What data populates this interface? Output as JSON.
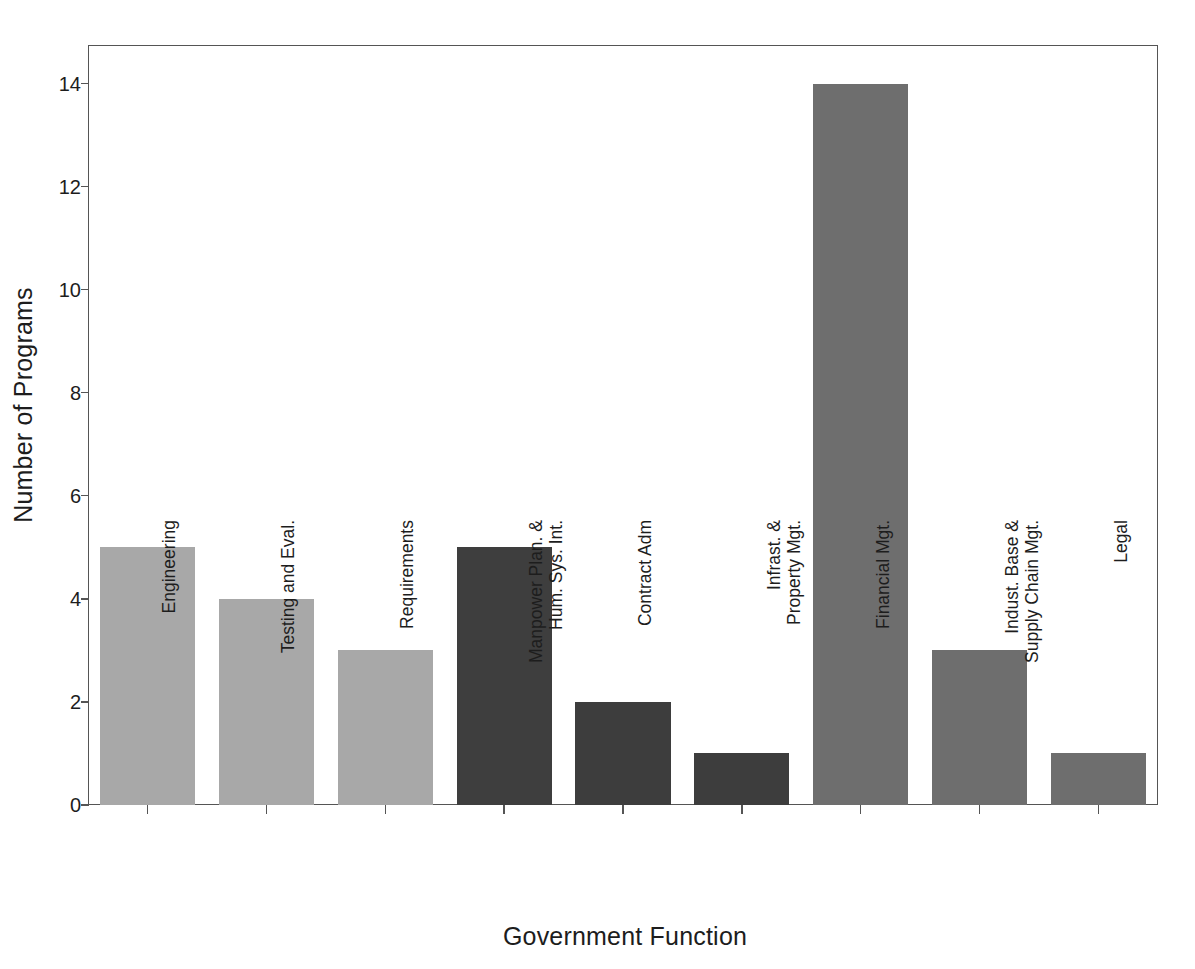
{
  "chart_data": {
    "type": "bar",
    "title": "",
    "xlabel": "Government Function",
    "ylabel": "Number of Programs",
    "categories": [
      "Engineering",
      "Testing and Eval.",
      "Requirements",
      "Manpower Plan. & Hum. Sys. Int.",
      "Contract Adm",
      "Infrast. & Property Mgt.",
      "Financial Mgt.",
      "Indust. Base & Supply Chain Mgt.",
      "Legal"
    ],
    "category_lines": [
      [
        "Engineering"
      ],
      [
        "Testing and Eval."
      ],
      [
        "Requirements"
      ],
      [
        "Manpower Plan. &",
        "Hum. Sys. Int."
      ],
      [
        "Contract Adm"
      ],
      [
        "Infrast. &",
        "Property Mgt."
      ],
      [
        "Financial Mgt."
      ],
      [
        "Indust. Base &",
        "Supply Chain Mgt."
      ],
      [
        "Legal"
      ]
    ],
    "values": [
      5,
      4,
      3,
      5,
      2,
      1,
      14,
      3,
      1
    ],
    "bar_colors": [
      "#a8a8a8",
      "#a8a8a8",
      "#a8a8a8",
      "#3e3e3e",
      "#3d3d3d",
      "#3d3d3d",
      "#6e6e6e",
      "#6e6e6e",
      "#6e6e6e"
    ],
    "ylim": [
      0,
      14.75
    ],
    "yticks": [
      0,
      2,
      4,
      6,
      8,
      10,
      12,
      14
    ],
    "ytick_labels": [
      "0",
      "2",
      "4",
      "6",
      "8",
      "10",
      "12",
      "14"
    ],
    "grid": false,
    "legend": null,
    "axis_color": "#555555",
    "text_color": "#1d1d1d",
    "background": "#ffffff"
  }
}
